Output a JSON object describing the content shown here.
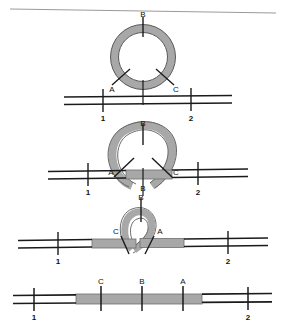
{
  "figure": {
    "title": "",
    "top_rule": true,
    "colors": {
      "strand_black": "#1a1a1a",
      "ring_fill": "#a8a8a8",
      "ring_stroke": "#4d4d4d",
      "gray_segment": "#a8a8a8",
      "gray_segment_stroke": "#6e6e6e",
      "rule_gray": "#9a9a9a",
      "background": "#ffffff"
    },
    "marker_labels": {
      "a": "A",
      "b": "B",
      "c": "C"
    },
    "position_labels": {
      "one": "1",
      "two": "2"
    },
    "panels": [
      {
        "id": "panel-1",
        "caption": "",
        "shape": "circle",
        "markers_on_shape": [
          "B",
          "A",
          "C"
        ],
        "marker_order_left_to_right": [
          "A",
          "C"
        ],
        "line_markers": [
          "1",
          "2"
        ],
        "line_gray_segments": 0
      },
      {
        "id": "panel-2",
        "caption": "",
        "shape": "loop-wide",
        "markers_on_shape": [
          "B",
          "A",
          "C"
        ],
        "marker_order_left_to_right": [
          "A",
          "C"
        ],
        "line_markers": [
          "1",
          "2"
        ],
        "line_gray_segments": 1
      },
      {
        "id": "panel-3",
        "caption": "",
        "shape": "loop-narrow",
        "markers_on_shape": [
          "B",
          "C",
          "A"
        ],
        "marker_order_left_to_right": [
          "C",
          "A"
        ],
        "line_markers": [
          "1",
          "2"
        ],
        "line_gray_segments": 2
      },
      {
        "id": "panel-4",
        "caption": "",
        "shape": "linear",
        "markers_on_shape": [
          "C",
          "B",
          "A"
        ],
        "marker_order_left_to_right": [
          "C",
          "B",
          "A"
        ],
        "line_markers": [
          "1",
          "2"
        ],
        "line_gray_segments": 1
      }
    ]
  }
}
